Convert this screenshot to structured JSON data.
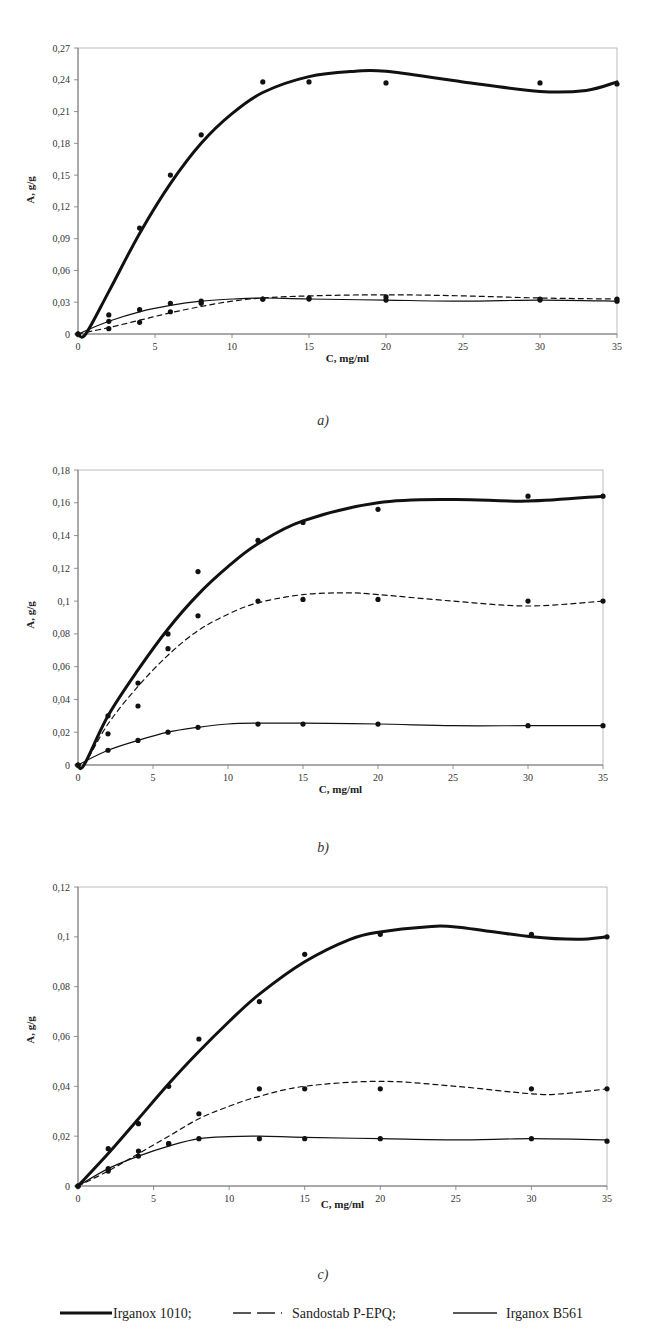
{
  "legend": {
    "items": [
      {
        "label": "Irganox 1010;",
        "style": "thick-solid"
      },
      {
        "label": "Sandostab P-EPQ;",
        "style": "dashed"
      },
      {
        "label": "Irganox B561",
        "style": "thin-solid"
      }
    ]
  },
  "chart_data": [
    {
      "type": "line",
      "caption": "a)",
      "xlabel": "C, mg/ml",
      "ylabel": "A, g/g",
      "xlim": [
        0,
        35
      ],
      "ylim": [
        0,
        0.27
      ],
      "xticks": [
        "0",
        "5",
        "10",
        "15",
        "20",
        "25",
        "30",
        "35"
      ],
      "yticks": [
        "0",
        "0,03",
        "0,06",
        "0,09",
        "0,12",
        "0,15",
        "0,18",
        "0,21",
        "0,24",
        "0,27"
      ],
      "grid": false,
      "x": [
        0,
        2,
        4,
        6,
        8,
        12,
        15,
        20,
        30,
        35
      ],
      "series": [
        {
          "name": "Irganox 1010",
          "values": [
            0,
            null,
            0.1,
            0.15,
            0.188,
            0.238,
            0.238,
            0.237,
            0.237,
            0.236
          ],
          "fit": [
            [
              0,
              0
            ],
            [
              0.5,
              0
            ],
            [
              2,
              0.04
            ],
            [
              4,
              0.095
            ],
            [
              6,
              0.142
            ],
            [
              8,
              0.18
            ],
            [
              10,
              0.208
            ],
            [
              12,
              0.228
            ],
            [
              15,
              0.243
            ],
            [
              18,
              0.248
            ],
            [
              20,
              0.248
            ],
            [
              25,
              0.238
            ],
            [
              30,
              0.229
            ],
            [
              33,
              0.23
            ],
            [
              35,
              0.238
            ]
          ]
        },
        {
          "name": "Sandostab P-EPQ",
          "values": [
            0,
            0.005,
            0.011,
            0.021,
            0.029,
            0.033,
            0.034,
            0.035,
            0.033,
            0.033
          ],
          "fit": [
            [
              0,
              0
            ],
            [
              2,
              0.006
            ],
            [
              4,
              0.013
            ],
            [
              6,
              0.02
            ],
            [
              8,
              0.026
            ],
            [
              10,
              0.031
            ],
            [
              12,
              0.034
            ],
            [
              15,
              0.036
            ],
            [
              20,
              0.037
            ],
            [
              25,
              0.036
            ],
            [
              30,
              0.034
            ],
            [
              35,
              0.033
            ]
          ]
        },
        {
          "name": "Irganox B561",
          "values": [
            0,
            0.012,
            0.023,
            0.029,
            0.031,
            0.033,
            0.033,
            0.032,
            0.032,
            0.031
          ],
          "fit": [
            [
              0,
              0
            ],
            [
              2,
              0.012
            ],
            [
              4,
              0.021
            ],
            [
              6,
              0.027
            ],
            [
              8,
              0.031
            ],
            [
              10,
              0.033
            ],
            [
              12,
              0.034
            ],
            [
              15,
              0.033
            ],
            [
              20,
              0.032
            ],
            [
              25,
              0.031
            ],
            [
              30,
              0.032
            ],
            [
              35,
              0.031
            ]
          ]
        }
      ],
      "extra_points": [
        [
          2,
          0.018
        ]
      ]
    },
    {
      "type": "line",
      "caption": "b)",
      "xlabel": "C, mg/ml",
      "ylabel": "A, g/g",
      "xlim": [
        0,
        35
      ],
      "ylim": [
        0,
        0.18
      ],
      "xticks": [
        "0",
        "5",
        "10",
        "15",
        "20",
        "25",
        "30",
        "35"
      ],
      "yticks": [
        "0",
        "0,02",
        "0,04",
        "0,06",
        "0,08",
        "0,1",
        "0,12",
        "0,14",
        "0,16",
        "0,18"
      ],
      "grid": false,
      "x": [
        0,
        2,
        4,
        6,
        8,
        12,
        15,
        20,
        30,
        35
      ],
      "series": [
        {
          "name": "Irganox 1010",
          "values": [
            0,
            0.03,
            0.05,
            0.08,
            0.118,
            0.137,
            0.148,
            0.156,
            0.164,
            0.164
          ],
          "fit": [
            [
              0,
              0
            ],
            [
              0.4,
              0
            ],
            [
              2,
              0.03
            ],
            [
              4,
              0.058
            ],
            [
              6,
              0.083
            ],
            [
              8,
              0.104
            ],
            [
              10,
              0.121
            ],
            [
              12,
              0.135
            ],
            [
              15,
              0.149
            ],
            [
              20,
              0.16
            ],
            [
              25,
              0.162
            ],
            [
              30,
              0.161
            ],
            [
              35,
              0.164
            ]
          ]
        },
        {
          "name": "Sandostab P-EPQ",
          "values": [
            0,
            0.019,
            0.036,
            0.071,
            0.091,
            0.1,
            0.101,
            0.101,
            0.1,
            0.1
          ],
          "fit": [
            [
              0,
              0
            ],
            [
              0.4,
              0
            ],
            [
              2,
              0.025
            ],
            [
              4,
              0.048
            ],
            [
              6,
              0.067
            ],
            [
              8,
              0.082
            ],
            [
              10,
              0.092
            ],
            [
              12,
              0.099
            ],
            [
              15,
              0.104
            ],
            [
              18,
              0.105
            ],
            [
              20,
              0.104
            ],
            [
              25,
              0.1
            ],
            [
              30,
              0.097
            ],
            [
              35,
              0.1
            ]
          ]
        },
        {
          "name": "Irganox B561",
          "values": [
            0,
            0.009,
            0.015,
            0.02,
            0.023,
            0.025,
            0.025,
            0.025,
            0.024,
            0.024
          ],
          "fit": [
            [
              0,
              0
            ],
            [
              2,
              0.009
            ],
            [
              4,
              0.015
            ],
            [
              6,
              0.02
            ],
            [
              8,
              0.023
            ],
            [
              10,
              0.025
            ],
            [
              12,
              0.0255
            ],
            [
              15,
              0.0255
            ],
            [
              20,
              0.025
            ],
            [
              25,
              0.024
            ],
            [
              30,
              0.024
            ],
            [
              35,
              0.024
            ]
          ]
        }
      ]
    },
    {
      "type": "line",
      "caption": "c)",
      "xlabel": "C, mg/ml",
      "ylabel": "A, g/g",
      "xlim": [
        0,
        35
      ],
      "ylim": [
        0,
        0.12
      ],
      "xticks": [
        "0",
        "5",
        "10",
        "15",
        "20",
        "25",
        "30",
        "35"
      ],
      "yticks": [
        "0",
        "0,02",
        "0,04",
        "0,06",
        "0,08",
        "0,1",
        "0,12"
      ],
      "grid": false,
      "x": [
        0,
        2,
        4,
        6,
        8,
        12,
        15,
        20,
        30,
        35
      ],
      "series": [
        {
          "name": "Irganox 1010",
          "values": [
            0,
            0.015,
            0.025,
            0.04,
            0.059,
            0.074,
            0.093,
            0.101,
            0.101,
            0.1
          ],
          "fit": [
            [
              0,
              0
            ],
            [
              2,
              0.013
            ],
            [
              4,
              0.027
            ],
            [
              6,
              0.041
            ],
            [
              8,
              0.054
            ],
            [
              10,
              0.066
            ],
            [
              12,
              0.077
            ],
            [
              15,
              0.09
            ],
            [
              18,
              0.099
            ],
            [
              20,
              0.102
            ],
            [
              23,
              0.104
            ],
            [
              25,
              0.104
            ],
            [
              30,
              0.1
            ],
            [
              33,
              0.099
            ],
            [
              35,
              0.1
            ]
          ]
        },
        {
          "name": "Sandostab P-EPQ",
          "values": [
            0,
            0.007,
            0.014,
            0.017,
            0.029,
            0.039,
            0.039,
            0.039,
            0.039,
            0.039
          ],
          "fit": [
            [
              0,
              0
            ],
            [
              2,
              0.006
            ],
            [
              4,
              0.013
            ],
            [
              6,
              0.02
            ],
            [
              8,
              0.027
            ],
            [
              10,
              0.032
            ],
            [
              12,
              0.036
            ],
            [
              15,
              0.04
            ],
            [
              20,
              0.042
            ],
            [
              25,
              0.04
            ],
            [
              30,
              0.037
            ],
            [
              32,
              0.037
            ],
            [
              35,
              0.039
            ]
          ]
        },
        {
          "name": "Irganox B561",
          "values": [
            0,
            0.006,
            0.012,
            0.017,
            0.019,
            0.019,
            0.019,
            0.019,
            0.019,
            0.018
          ],
          "fit": [
            [
              0,
              0
            ],
            [
              2,
              0.007
            ],
            [
              4,
              0.012
            ],
            [
              6,
              0.016
            ],
            [
              8,
              0.019
            ],
            [
              10,
              0.0198
            ],
            [
              12,
              0.02
            ],
            [
              15,
              0.0195
            ],
            [
              20,
              0.019
            ],
            [
              25,
              0.0185
            ],
            [
              30,
              0.019
            ],
            [
              35,
              0.0185
            ]
          ]
        }
      ]
    }
  ],
  "layout": {
    "panels": [
      {
        "left": 78,
        "right": 617,
        "top": 48,
        "bottom": 334,
        "caption_y": 425,
        "ylabel_y": 190
      },
      {
        "left": 78,
        "right": 603,
        "top": 470,
        "bottom": 765,
        "caption_y": 852,
        "ylabel_y": 615
      },
      {
        "left": 78,
        "right": 607,
        "top": 887,
        "bottom": 1186,
        "caption_y": 1279,
        "ylabel_y": 1030
      }
    ]
  }
}
